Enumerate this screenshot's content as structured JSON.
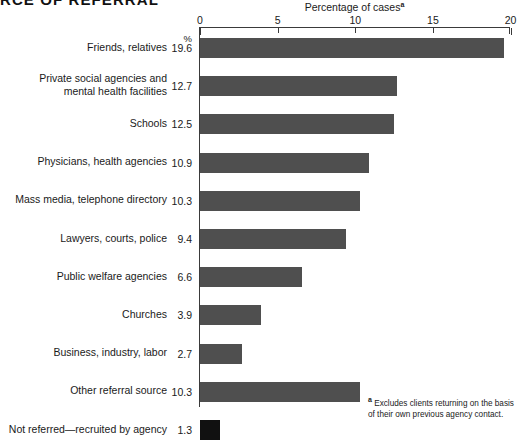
{
  "title": "RCE OF REFERRAL",
  "percent_symbol": "%",
  "footnote_marker": "a",
  "footnote_text": "Excludes clients returning on the basis of their own previous agency contact.",
  "chart_data": {
    "type": "bar",
    "orientation": "horizontal",
    "title": "Percentage of cases",
    "title_superscript": "a",
    "xlabel": "Percentage of cases",
    "ylabel": "",
    "xlim": [
      0,
      20
    ],
    "xticks": [
      0,
      5,
      10,
      15,
      20
    ],
    "xtick_labels": [
      "0",
      "5",
      "10",
      "15",
      "20"
    ],
    "grid": false,
    "legend": "none",
    "value_suffix": "%",
    "categories": [
      "Friends, relatives",
      "Private social agencies and\nmental health facilities",
      "Schools",
      "Physicians, health agencies",
      "Mass media, telephone directory",
      "Lawyers, courts, police",
      "Public welfare agencies",
      "Churches",
      "Business, industry, labor",
      "Other referral source",
      "Not referred—recruited by agency"
    ],
    "values": [
      19.6,
      12.7,
      12.5,
      10.9,
      10.3,
      9.4,
      6.6,
      3.9,
      2.7,
      10.3,
      1.3
    ],
    "value_labels": [
      "19.6",
      "12.7",
      "12.5",
      "10.9",
      "10.3",
      "9.4",
      "6.6",
      "3.9",
      "2.7",
      "10.3",
      "1.3"
    ],
    "bar_colors": [
      "#4f4f4f",
      "#4f4f4f",
      "#4f4f4f",
      "#4f4f4f",
      "#4f4f4f",
      "#4f4f4f",
      "#4f4f4f",
      "#4f4f4f",
      "#4f4f4f",
      "#4f4f4f",
      "#111111"
    ]
  }
}
